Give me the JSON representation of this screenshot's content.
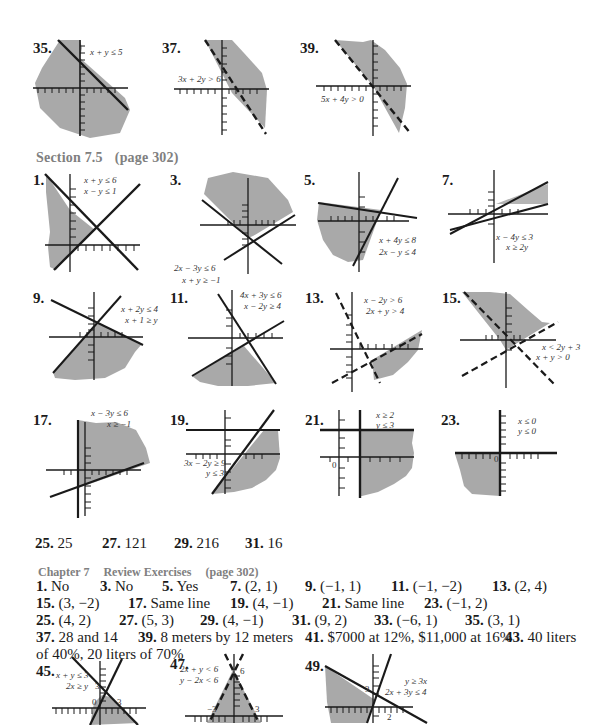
{
  "colors": {
    "shade": "#a9a9a9",
    "ink": "#1a1a1a",
    "heading": "#808080",
    "background": "#ffffff"
  },
  "top_graphs": [
    {
      "num": "35.",
      "inequalities": [
        "x + y ≤ 5"
      ]
    },
    {
      "num": "37.",
      "inequalities": [
        "3x + 2y > 6"
      ]
    },
    {
      "num": "39.",
      "inequalities": [
        "5x + 4y > 0"
      ]
    }
  ],
  "section_7_5": {
    "title": "Section 7.5",
    "page": "(page 302)",
    "graphs": [
      {
        "num": "1.",
        "inequalities": [
          "x + y ≤ 6",
          "x − y ≤ 1"
        ]
      },
      {
        "num": "3.",
        "inequalities": [
          "2x − 3y ≤ 6",
          "x + y ≥ −1"
        ]
      },
      {
        "num": "5.",
        "inequalities": [
          "x + 4y ≤ 8",
          "2x − y ≤ 4"
        ]
      },
      {
        "num": "7.",
        "inequalities": [
          "x − 4y ≤ 3",
          "x ≥ 2y"
        ]
      },
      {
        "num": "9.",
        "inequalities": [
          "x + 2y ≤ 4",
          "x + 1 ≥ y"
        ]
      },
      {
        "num": "11.",
        "inequalities": [
          "4x + 3y ≤ 6",
          "x − 2y ≥ 4"
        ]
      },
      {
        "num": "13.",
        "inequalities": [
          "x − 2y > 6",
          "2x + y > 4"
        ]
      },
      {
        "num": "15.",
        "inequalities": [
          "x < 2y + 3",
          "x + y > 0"
        ]
      },
      {
        "num": "17.",
        "inequalities": [
          "x − 3y ≤ 6",
          "x ≥ −1"
        ]
      },
      {
        "num": "19.",
        "inequalities": [
          "3x − 2y ≥ 9",
          "y ≤ 3"
        ]
      },
      {
        "num": "21.",
        "inequalities": [
          "x ≥ 2",
          "y ≤ 3"
        ],
        "tick_label": "0"
      },
      {
        "num": "23.",
        "inequalities": [
          "x ≤ 0",
          "y ≤ 0"
        ],
        "tick_label": "0"
      }
    ],
    "answers": [
      {
        "num": "25.",
        "value": "25"
      },
      {
        "num": "27.",
        "value": "121"
      },
      {
        "num": "29.",
        "value": "216"
      },
      {
        "num": "31.",
        "value": "16"
      }
    ]
  },
  "review": {
    "chapter": "Chapter 7",
    "title": "Review Exercises",
    "page": "(page 302)",
    "answers": [
      {
        "num": "1.",
        "value": "No"
      },
      {
        "num": "3.",
        "value": "No"
      },
      {
        "num": "5.",
        "value": "Yes"
      },
      {
        "num": "7.",
        "value": "(2, 1)"
      },
      {
        "num": "9.",
        "value": "(−1, 1)"
      },
      {
        "num": "11.",
        "value": "(−1, −2)"
      },
      {
        "num": "13.",
        "value": "(2, 4)"
      },
      {
        "num": "15.",
        "value": "(3, −2)"
      },
      {
        "num": "17.",
        "value": "Same line"
      },
      {
        "num": "19.",
        "value": "(4, −1)"
      },
      {
        "num": "21.",
        "value": "Same line"
      },
      {
        "num": "23.",
        "value": "(−1, 2)"
      },
      {
        "num": "25.",
        "value": "(4, 2)"
      },
      {
        "num": "27.",
        "value": "(5, 3)"
      },
      {
        "num": "29.",
        "value": "(4, −1)"
      },
      {
        "num": "31.",
        "value": "(9, 2)"
      },
      {
        "num": "33.",
        "value": "(−6, 1)"
      },
      {
        "num": "35.",
        "value": "(3, 1)"
      },
      {
        "num": "37.",
        "value": "28 and 14"
      },
      {
        "num": "39.",
        "value": "8 meters by 12 meters"
      },
      {
        "num": "41.",
        "value": "$7000 at 12%, $11,000 at 16%"
      },
      {
        "num": "43.",
        "value": "40 liters",
        "continuation": "of 40%, 20 liters of 70%"
      }
    ],
    "graphs": [
      {
        "num": "45.",
        "inequalities": [
          "x + y ≤ 3",
          "2x ≥ y"
        ],
        "tick_labels": [
          "3",
          "0",
          "3"
        ]
      },
      {
        "num": "47.",
        "inequalities": [
          "2x + y < 6",
          "y − 2x < 6"
        ],
        "tick_labels": [
          "6",
          "−3",
          "3"
        ]
      },
      {
        "num": "49.",
        "inequalities": [
          "y ≥ 3x",
          "2x + 3y ≤ 4"
        ],
        "tick_labels": [
          "3",
          "2"
        ]
      }
    ]
  }
}
